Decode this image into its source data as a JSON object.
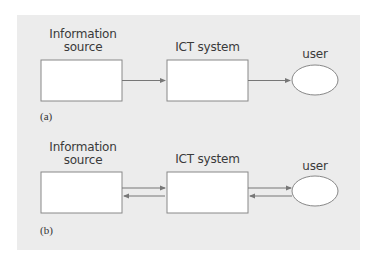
{
  "diagram_a": {
    "caption": "(a)",
    "nodes": [
      {
        "id": "info_source",
        "label_line1": "Information",
        "label_line2": "source",
        "shape": "rectangle"
      },
      {
        "id": "ict_system",
        "label": "ICT system",
        "shape": "rectangle"
      },
      {
        "id": "user",
        "label": "user",
        "shape": "ellipse"
      }
    ],
    "edges": [
      {
        "from": "info_source",
        "to": "ict_system",
        "direction": "one-way"
      },
      {
        "from": "ict_system",
        "to": "user",
        "direction": "one-way"
      }
    ]
  },
  "diagram_b": {
    "caption": "(b)",
    "nodes": [
      {
        "id": "info_source",
        "label_line1": "Information",
        "label_line2": "source",
        "shape": "rectangle"
      },
      {
        "id": "ict_system",
        "label": "ICT system",
        "shape": "rectangle"
      },
      {
        "id": "user",
        "label": "user",
        "shape": "ellipse"
      }
    ],
    "edges": [
      {
        "from": "info_source",
        "to": "ict_system",
        "direction": "two-way"
      },
      {
        "from": "ict_system",
        "to": "user",
        "direction": "two-way"
      }
    ]
  },
  "colors": {
    "panel": "#ececec",
    "stroke": "#777777",
    "fill": "#ffffff",
    "text": "#3a3a3a"
  }
}
